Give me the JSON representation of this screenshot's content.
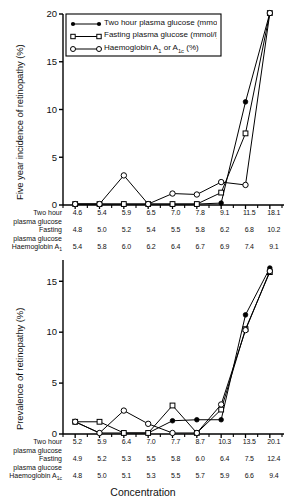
{
  "figure": {
    "xaxis_title": "Concentration"
  },
  "legend": {
    "items": [
      {
        "label": "Two hour plasma glucose (mmol/l)",
        "marker": "filled-circle-icon"
      },
      {
        "label": "Fasting plasma glucose (mmol/l)",
        "marker": "open-square-icon"
      },
      {
        "label": "Haemoglobin A<sub>1</sub> or A<sub>1c</sub> (%)",
        "marker": "open-circle-icon"
      }
    ]
  },
  "row_labels": {
    "two_hour": "Two hour",
    "plasma_glucose": "plasma glucose",
    "fasting": "Fasting",
    "haemoglobin_a1": "Haemoglobin A<sub>1</sub>",
    "haemoglobin_a1c": "Haemoglobin A<sub>1c</sub>"
  },
  "chart_data": [
    {
      "type": "line",
      "id": "five-year-incidence",
      "title": "",
      "xlabel": "Concentration",
      "ylabel": "Five year incidence of retinopathy (%)",
      "ylim": [
        0,
        20
      ],
      "yticks": [
        0,
        5,
        10,
        15,
        20
      ],
      "ytick_labels": [
        "0",
        "5",
        "10",
        "15",
        "20"
      ],
      "grid": false,
      "legend_position": "top-center",
      "categories": [
        "1",
        "2",
        "3",
        "4",
        "5",
        "6",
        "7",
        "8",
        "9"
      ],
      "tick_labels": {
        "two_hour_plasma_glucose": [
          "4.6",
          "5.4",
          "5.9",
          "6.5",
          "7.0",
          "7.8",
          "9.1",
          "11.5",
          "18.1"
        ],
        "fasting_plasma_glucose": [
          "4.8",
          "5.0",
          "5.2",
          "5.4",
          "5.5",
          "5.8",
          "6.2",
          "6.8",
          "10.2"
        ],
        "haemoglobin": [
          "5.4",
          "5.8",
          "6.0",
          "6.2",
          "6.4",
          "6.7",
          "6.9",
          "7.4",
          "9.1"
        ]
      },
      "series": [
        {
          "name": "Two hour plasma glucose (mmol/l)",
          "marker": "filled-circle",
          "values": [
            0.1,
            0.1,
            0.1,
            0.1,
            0.1,
            0.1,
            0.2,
            10.8,
            20.1
          ]
        },
        {
          "name": "Fasting plasma glucose (mmol/l)",
          "marker": "open-square",
          "values": [
            0.1,
            0.1,
            0.1,
            0.1,
            0.1,
            0.1,
            1.3,
            7.5,
            20.1
          ]
        },
        {
          "name": "Haemoglobin A1 or A1c (%)",
          "marker": "open-circle",
          "values": [
            0.1,
            0.1,
            3.1,
            0.1,
            1.2,
            1.1,
            2.4,
            2.1,
            20.1
          ]
        }
      ]
    },
    {
      "type": "line",
      "id": "prevalence",
      "title": "",
      "xlabel": "Concentration",
      "ylabel": "Prevalence of retinopathy (%)",
      "ylim": [
        0,
        16.5
      ],
      "yticks": [
        0,
        5,
        10,
        15
      ],
      "ytick_labels": [
        "0",
        "5",
        "10",
        "15"
      ],
      "grid": false,
      "legend_position": "none",
      "categories": [
        "1",
        "2",
        "3",
        "4",
        "5",
        "6",
        "7",
        "8",
        "9"
      ],
      "tick_labels": {
        "two_hour_plasma_glucose": [
          "5.2",
          "5.9",
          "6.4",
          "7.0",
          "7.7",
          "8.7",
          "10.3",
          "13.5",
          "20.1"
        ],
        "fasting_plasma_glucose": [
          "4.9",
          "5.2",
          "5.3",
          "5.5",
          "5.8",
          "6.0",
          "6.4",
          "7.5",
          "12.4"
        ],
        "haemoglobin": [
          "4.8",
          "5.0",
          "5.1",
          "5.3",
          "5.5",
          "5.7",
          "5.9",
          "6.6",
          "9.4"
        ]
      },
      "series": [
        {
          "name": "Two hour plasma glucose (mmol/l)",
          "marker": "filled-circle",
          "values": [
            1.2,
            0.1,
            0.1,
            0.1,
            1.3,
            1.4,
            1.4,
            11.7,
            16.3
          ]
        },
        {
          "name": "Fasting plasma glucose (mmol/l)",
          "marker": "open-square",
          "values": [
            1.2,
            1.2,
            0.1,
            0.1,
            2.8,
            0.1,
            2.4,
            10.3,
            15.9
          ]
        },
        {
          "name": "Haemoglobin A1 or A1c (%)",
          "marker": "open-circle",
          "values": [
            1.2,
            0.1,
            2.3,
            1.0,
            0.1,
            0.1,
            2.9,
            10.2,
            16.0
          ]
        }
      ]
    }
  ]
}
